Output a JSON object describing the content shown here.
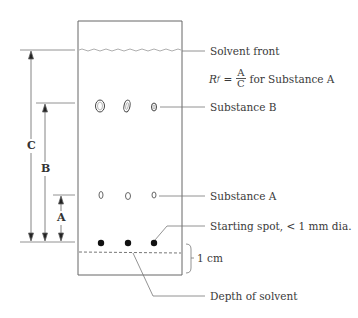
{
  "diagram": {
    "type": "thin-layer-chromatography-plate",
    "labels": {
      "solvent_front": "Solvent front",
      "substance_b": "Substance B",
      "substance_a": "Substance A",
      "starting_spot": "Starting spot, < 1 mm dia.",
      "one_cm": "1 cm",
      "depth_of_solvent": "Depth of solvent"
    },
    "formula": {
      "symbol": "R",
      "subscript": "f",
      "equals": "=",
      "numerator": "A",
      "denominator": "C",
      "suffix": "for Substance A"
    },
    "dimensions": {
      "c": "C",
      "b": "B",
      "a": "A"
    },
    "spots": {
      "substance_b_count": 3,
      "substance_a_count": 3,
      "starting_count": 3
    },
    "colors": {
      "line": "#555555",
      "spot": "#111111",
      "text": "#3a3a3a"
    }
  }
}
